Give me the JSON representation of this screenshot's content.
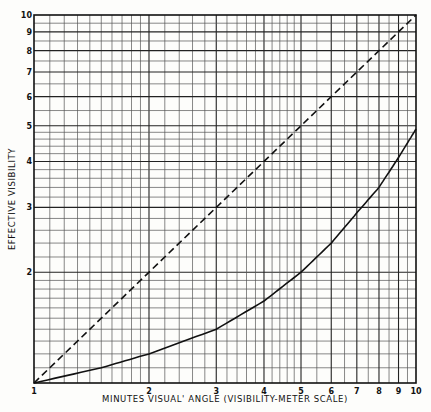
{
  "chart_data": {
    "type": "line",
    "title": "",
    "xlabel": "MINUTES VISUAL ANGLE (VISIBILITY-METER SCALE)",
    "ylabel": "EFFECTIVE VISIBILITY",
    "xscale": "log",
    "yscale": "log",
    "xlim": [
      1,
      10
    ],
    "ylim": [
      1,
      10
    ],
    "grid": true,
    "x_ticks": [
      1,
      2,
      3,
      4,
      5,
      6,
      7,
      8,
      9,
      10
    ],
    "y_ticks": [
      2,
      3,
      4,
      5,
      6,
      7,
      8,
      9,
      10
    ],
    "x_tick_labels": [
      "1",
      "2",
      "3",
      "4",
      "5",
      "6",
      "7",
      "8",
      "9",
      "10"
    ],
    "y_tick_labels": [
      "2",
      "3",
      "4",
      "5",
      "6",
      "7",
      "8",
      "9",
      "10"
    ],
    "series": [
      {
        "name": "reference (dashed)",
        "style": "dashed",
        "x": [
          1,
          2,
          3,
          4,
          5,
          6,
          7,
          8,
          9,
          10
        ],
        "values": [
          1,
          2,
          3,
          4,
          5,
          6,
          7,
          8,
          9,
          10
        ]
      },
      {
        "name": "effective visibility (solid)",
        "style": "solid",
        "x": [
          1,
          1.5,
          2,
          3,
          4,
          5,
          6,
          7,
          8,
          9,
          10
        ],
        "values": [
          1,
          1.1,
          1.2,
          1.4,
          1.67,
          2.0,
          2.4,
          2.9,
          3.4,
          4.1,
          4.9
        ]
      }
    ]
  },
  "labels": {
    "xlabel": "MINUTES VISUAL' ANGLE (VISIBILITY-METER SCALE)",
    "ylabel": "EFFECTIVE VISIBILITY",
    "x_origin": "1"
  }
}
